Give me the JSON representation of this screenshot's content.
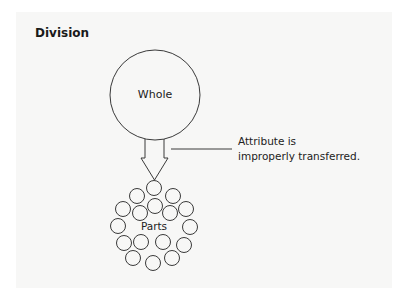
{
  "figure": {
    "title": "Division",
    "whole_label": "Whole",
    "parts_label": "Parts",
    "callout": {
      "line1": "Attribute is",
      "line2": "improperly transferred."
    },
    "colors": {
      "stroke": "#3a3a3a",
      "text": "#222222",
      "background": "#f7f7f6"
    }
  }
}
